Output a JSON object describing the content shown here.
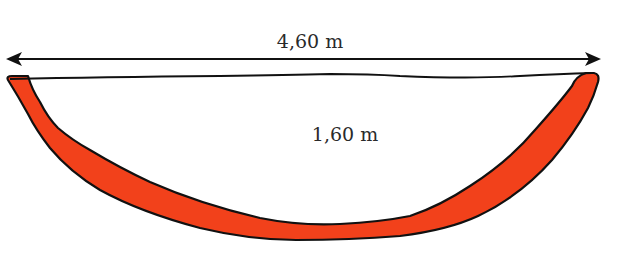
{
  "diagram": {
    "type": "bowl-cross-section",
    "width_label": "4,60 m",
    "depth_label": "1,60 m",
    "colors": {
      "fill": "#F2411B",
      "outline": "#111111",
      "text": "#2a2a2a",
      "background": "#ffffff"
    }
  }
}
